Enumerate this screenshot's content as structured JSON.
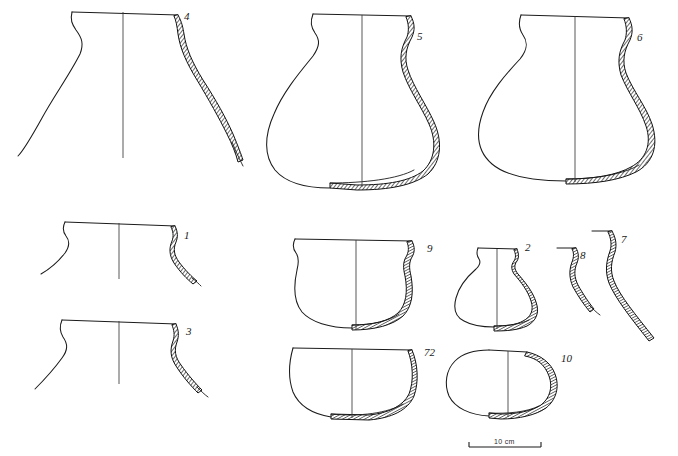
{
  "plate": {
    "title": "Pottery profile plate",
    "description": "Archaeological vessel profile drawings",
    "background_color": "#ffffff",
    "ink_color": "#1b1b1b"
  },
  "scale": {
    "label": "10 cm",
    "name": "scale-bar"
  },
  "vessels": [
    {
      "id": "vessel-4",
      "label": "4",
      "type": "large jar with everted rim and narrow neck",
      "completeness": "upper body profile",
      "label_x": 184,
      "label_y": 20
    },
    {
      "id": "vessel-5",
      "label": "5",
      "type": "globular jar with short everted neck",
      "completeness": "complete profile",
      "label_x": 417,
      "label_y": 40
    },
    {
      "id": "vessel-6",
      "label": "6",
      "type": "wide squat globular jar",
      "completeness": "complete profile",
      "label_x": 637,
      "label_y": 41
    },
    {
      "id": "vessel-1",
      "label": "1",
      "type": "everted rim sherd",
      "completeness": "rim and neck fragment",
      "label_x": 184,
      "label_y": 239
    },
    {
      "id": "vessel-3",
      "label": "3",
      "type": "everted rim sherd",
      "completeness": "rim and neck fragment",
      "label_x": 186,
      "label_y": 335
    },
    {
      "id": "vessel-9",
      "label": "9",
      "type": "hemispherical bowl with inturned rim",
      "completeness": "complete profile",
      "label_x": 427,
      "label_y": 252
    },
    {
      "id": "vessel-2",
      "label": "2",
      "type": "small carinated jar with narrow neck",
      "completeness": "complete profile",
      "label_x": 525,
      "label_y": 251
    },
    {
      "id": "vessel-8",
      "label": "8",
      "type": "everted rim sherd, section only",
      "completeness": "rim fragment",
      "label_x": 580,
      "label_y": 259
    },
    {
      "id": "vessel-7",
      "label": "7",
      "type": "everted rim sherd, section only",
      "completeness": "rim and wall fragment",
      "label_x": 621,
      "label_y": 243
    },
    {
      "id": "vessel-72",
      "label": "72",
      "type": "deep hemispherical bowl with direct rim",
      "completeness": "complete profile",
      "label_x": 424,
      "label_y": 356
    },
    {
      "id": "vessel-10",
      "label": "10",
      "type": "small closed ovoid pot with restricted mouth",
      "completeness": "complete profile",
      "label_x": 561,
      "label_y": 362
    }
  ]
}
